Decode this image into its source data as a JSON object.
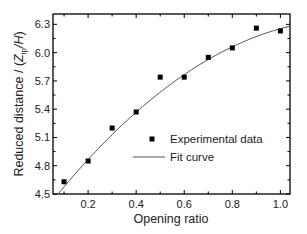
{
  "chart_data": {
    "type": "scatter",
    "title": "",
    "xlabel": "Opening ratio",
    "ylabel": "Reduced distance / (Z_ip/H)",
    "ylabel_parts": {
      "prefix": "Reduced distance / (",
      "var": "Z",
      "sub": "ip",
      "suffix": "/H)"
    },
    "xlim": [
      0.054,
      1.04
    ],
    "ylim": [
      4.5,
      6.41
    ],
    "xticks": [
      0.2,
      0.4,
      0.6,
      0.8,
      1.0
    ],
    "xtick_labels": [
      "0.2",
      "0.4",
      "0.6",
      "0.8",
      "1.0"
    ],
    "xminor": [
      0.1,
      0.3,
      0.5,
      0.7,
      0.9
    ],
    "yticks": [
      4.5,
      4.8,
      5.1,
      5.4,
      5.7,
      6.0,
      6.3
    ],
    "ytick_labels": [
      "4.5",
      "4.8",
      "5.1",
      "5.4",
      "5.7",
      "6.0",
      "6.3"
    ],
    "yminor": [
      4.65,
      4.95,
      5.25,
      5.55,
      5.85,
      6.15
    ],
    "grid": false,
    "legend_position": "inside-center-right",
    "series": [
      {
        "name": "Experimental data",
        "kind": "scatter",
        "marker": "square",
        "color": "#000000",
        "x": [
          0.1,
          0.2,
          0.3,
          0.4,
          0.5,
          0.6,
          0.7,
          0.8,
          0.9,
          1.0
        ],
        "y": [
          4.63,
          4.85,
          5.2,
          5.37,
          5.74,
          5.74,
          5.95,
          6.05,
          6.26,
          6.23
        ]
      },
      {
        "name": "Fit curve",
        "kind": "line",
        "color": "#555555",
        "model": "quadratic",
        "coefficients": {
          "a": 4.261,
          "b": 3.283,
          "c": -1.29
        },
        "x_range": [
          0.075,
          1.04
        ]
      }
    ]
  },
  "legend": {
    "items": [
      {
        "label": "Experimental data"
      },
      {
        "label": "Fit curve"
      }
    ]
  }
}
